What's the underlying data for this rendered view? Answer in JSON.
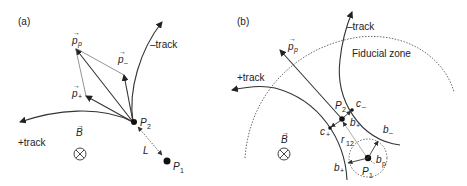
{
  "panel_a": {
    "label": "(a)",
    "momentum_p": "p",
    "momentum_p_sub": "p",
    "momentum_minus": "p",
    "momentum_minus_sub": "–",
    "momentum_plus": "p",
    "momentum_plus_sub": "+",
    "minus_track": "–track",
    "plus_track": "+track",
    "point_p2": "P",
    "point_p2_sub": "2",
    "point_p1": "P",
    "point_p1_sub": "1",
    "distance": "L",
    "field": "B"
  },
  "panel_b": {
    "label": "(b)",
    "momentum_p": "p",
    "momentum_p_sub": "p",
    "minus_track": "–track",
    "plus_track": "+track",
    "fiducial": "Fiducial zone",
    "point_p2": "P",
    "point_p2_sub": "2",
    "point_p1": "P",
    "point_p1_sub": "1",
    "c_minus": "c",
    "c_minus_sub": "–",
    "c_plus": "c",
    "c_plus_sub": "+",
    "b_plus_inner": "b",
    "b_plus_inner_sub": "+",
    "b_minus": "b",
    "b_minus_sub": "–",
    "b_plus": "b",
    "b_plus_sub": "+",
    "b_p": "b",
    "b_p_sub": "p",
    "r12": "r",
    "r12_sub": "12",
    "field": "B"
  }
}
